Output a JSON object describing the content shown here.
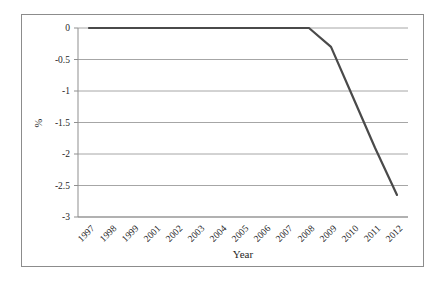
{
  "figure": {
    "frame_border_color": "#8c8c8c",
    "background": "#ffffff"
  },
  "chart_data": {
    "type": "line",
    "title": "",
    "xlabel": "Year",
    "ylabel": "%",
    "categories": [
      "1997",
      "1998",
      "1999",
      "2001",
      "2002",
      "2003",
      "2004",
      "2005",
      "2006",
      "2007",
      "2008",
      "2009",
      "2010",
      "2011",
      "2012"
    ],
    "series": [
      {
        "name": "",
        "values": [
          0,
          0,
          0,
          0,
          0,
          0,
          0,
          0,
          0,
          0,
          0,
          -0.3,
          -1.1,
          -1.9,
          -2.65
        ]
      }
    ],
    "ylim": [
      -3,
      0
    ],
    "ytick_values": [
      0,
      -0.5,
      -1,
      -1.5,
      -2,
      -2.5,
      -3
    ],
    "ytick_labels": [
      "0",
      "-0.5",
      "-1",
      "-1.5",
      "-2",
      "-2.5",
      "-3"
    ],
    "grid": "horizontal-only",
    "legend": "none",
    "x_tick_rotation_deg": -45,
    "line_color": "#4a4a4a",
    "gridline_color": "#a6a6a6",
    "axis_color": "#8f8f8f",
    "text_color": "#1f1f1f"
  }
}
